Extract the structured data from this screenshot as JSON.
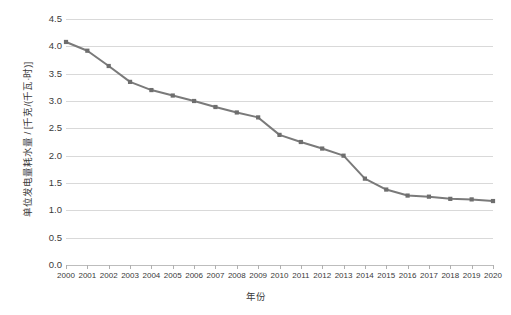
{
  "chart_data": {
    "type": "line",
    "title": "",
    "xlabel": "年份",
    "ylabel": "单位发电量耗水量 / [千克/(千瓦·时)]",
    "categories": [
      "2000",
      "2001",
      "2002",
      "2003",
      "2004",
      "2005",
      "2006",
      "2007",
      "2008",
      "2009",
      "2010",
      "2011",
      "2012",
      "2013",
      "2014",
      "2015",
      "2016",
      "2017",
      "2018",
      "2019",
      "2020"
    ],
    "values": [
      4.08,
      3.92,
      3.64,
      3.35,
      3.2,
      3.1,
      3.0,
      2.89,
      2.79,
      2.7,
      2.38,
      2.25,
      2.13,
      2.0,
      1.58,
      1.38,
      1.27,
      1.25,
      1.21,
      1.2,
      1.17
    ],
    "series": [
      {
        "name": "单位发电量耗水量",
        "values": [
          4.08,
          3.92,
          3.64,
          3.35,
          3.2,
          3.1,
          3.0,
          2.89,
          2.79,
          2.7,
          2.38,
          2.25,
          2.13,
          2.0,
          1.58,
          1.38,
          1.27,
          1.25,
          1.21,
          1.2,
          1.17
        ]
      }
    ],
    "ylim": [
      0.0,
      4.5
    ],
    "ytick_labels": [
      "0.0",
      "0.5",
      "1.0",
      "1.5",
      "2.0",
      "2.5",
      "3.0",
      "3.5",
      "4.0",
      "4.5"
    ],
    "ytick_values": [
      0.0,
      0.5,
      1.0,
      1.5,
      2.0,
      2.5,
      3.0,
      3.5,
      4.0,
      4.5
    ],
    "grid": true,
    "grid_axis": "y",
    "legend": false,
    "legend_position": "none",
    "line_color": "#7a7a7a",
    "marker_color": "#6e6e6e",
    "marker_shape": "square",
    "gridline_color": "#d9d9d9",
    "text_color": "#3a3a3a",
    "background_color": "#ffffff"
  }
}
